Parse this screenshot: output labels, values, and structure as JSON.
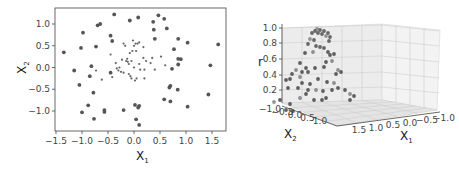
{
  "chart_data": [
    {
      "type": "scatter",
      "title": "",
      "xlabel": "X1",
      "ylabel": "X2",
      "xlim": [
        -1.5,
        1.8
      ],
      "ylim": [
        -1.45,
        1.35
      ],
      "xticks": [
        "-1.5",
        "-1.0",
        "-0.5",
        "0.0",
        "0.5",
        "1.0",
        "1.5"
      ],
      "yticks": [
        "1.0",
        "0.5",
        "0.0",
        "-0.5",
        "-1.0"
      ],
      "grid": false,
      "legend": null,
      "series": [
        {
          "name": "outer (large dots)",
          "marker": "circle",
          "color": "#555555",
          "points": [
            [
              -1.35,
              0.35
            ],
            [
              -1.15,
              -0.07
            ],
            [
              -1.05,
              -0.4
            ],
            [
              -1.02,
              0.45
            ],
            [
              -1.0,
              -1.03
            ],
            [
              -0.98,
              0.8
            ],
            [
              -0.88,
              -0.87
            ],
            [
              -0.85,
              -0.2
            ],
            [
              -0.82,
              0.03
            ],
            [
              -0.78,
              -0.58
            ],
            [
              -0.77,
              -1.18
            ],
            [
              -0.73,
              0.48
            ],
            [
              -0.7,
              0.97
            ],
            [
              -0.65,
              1.0
            ],
            [
              -0.57,
              -0.98
            ],
            [
              -0.57,
              -1.02
            ],
            [
              -0.45,
              0.73
            ],
            [
              -0.45,
              -0.12
            ],
            [
              -0.42,
              0.61
            ],
            [
              -0.38,
              1.22
            ],
            [
              -0.2,
              -0.98
            ],
            [
              -0.08,
              1.08
            ],
            [
              0.02,
              -0.86
            ],
            [
              0.04,
              -1.19
            ],
            [
              0.08,
              -0.92
            ],
            [
              0.1,
              -0.88
            ],
            [
              0.08,
              1.15
            ],
            [
              0.1,
              -1.32
            ],
            [
              0.37,
              1.05
            ],
            [
              0.38,
              0.87
            ],
            [
              0.4,
              0.66
            ],
            [
              0.47,
              1.2
            ],
            [
              0.58,
              1.12
            ],
            [
              0.63,
              0.9
            ],
            [
              0.58,
              -0.73
            ],
            [
              0.68,
              -0.46
            ],
            [
              0.7,
              -0.42
            ],
            [
              0.7,
              -0.78
            ],
            [
              0.73,
              -0.03
            ],
            [
              0.77,
              0.42
            ],
            [
              0.85,
              0.66
            ],
            [
              0.85,
              0.2
            ],
            [
              0.85,
              0.07
            ],
            [
              0.9,
              0.19
            ],
            [
              0.84,
              -0.51
            ],
            [
              1.03,
              0.57
            ],
            [
              1.03,
              -0.9
            ],
            [
              1.43,
              -0.62
            ],
            [
              1.47,
              0.05
            ],
            [
              1.62,
              0.53
            ]
          ]
        },
        {
          "name": "inner (small dots)",
          "marker": "circle-small",
          "color": "#666666",
          "points": [
            [
              -0.73,
              -0.07
            ],
            [
              -0.62,
              -0.28
            ],
            [
              -0.45,
              0.3
            ],
            [
              -0.42,
              -0.22
            ],
            [
              -0.35,
              0.1
            ],
            [
              -0.33,
              -0.02
            ],
            [
              -0.3,
              -0.07
            ],
            [
              -0.28,
              0.0
            ],
            [
              -0.25,
              -0.1
            ],
            [
              -0.23,
              0.18
            ],
            [
              -0.2,
              0.55
            ],
            [
              -0.2,
              -0.12
            ],
            [
              -0.17,
              0.5
            ],
            [
              -0.15,
              0.15
            ],
            [
              -0.13,
              0.2
            ],
            [
              -0.12,
              0.13
            ],
            [
              -0.1,
              -0.15
            ],
            [
              -0.1,
              0.08
            ],
            [
              -0.08,
              0.33
            ],
            [
              -0.07,
              -0.2
            ],
            [
              -0.05,
              0.15
            ],
            [
              -0.05,
              -0.25
            ],
            [
              -0.03,
              0.38
            ],
            [
              -0.02,
              0.62
            ],
            [
              0.0,
              0.5
            ],
            [
              0.0,
              0.0
            ],
            [
              0.02,
              -0.3
            ],
            [
              0.03,
              0.55
            ],
            [
              0.04,
              0.38
            ],
            [
              0.05,
              -0.25
            ],
            [
              0.07,
              0.55
            ],
            [
              0.1,
              0.58
            ],
            [
              0.1,
              0.08
            ],
            [
              0.12,
              -0.05
            ],
            [
              0.18,
              0.47
            ],
            [
              0.18,
              0.22
            ],
            [
              0.2,
              -0.05
            ],
            [
              0.2,
              -0.25
            ],
            [
              0.23,
              0.15
            ],
            [
              0.32,
              0.1
            ],
            [
              0.35,
              0.22
            ],
            [
              0.4,
              -0.05
            ],
            [
              0.52,
              0.25
            ],
            [
              0.6,
              0.05
            ]
          ]
        }
      ]
    },
    {
      "type": "scatter3d",
      "title": "",
      "xlabel": "X1",
      "ylabel": "X2",
      "zlabel": "r",
      "xticks": [
        "1.5",
        "1.0",
        "0.5",
        "0.0",
        "-0.5",
        "-1.0"
      ],
      "yticks": [
        "-1.0",
        "-0.5",
        "0.0",
        "0.5",
        "1.0"
      ],
      "zticks": [
        "0.2",
        "0.4",
        "0.6",
        "0.8",
        "1.0"
      ],
      "zlim": [
        0.0,
        1.0
      ],
      "grid": true,
      "legend": null,
      "description": "Points plotted with height r = radial (RBF-like) function of X1, X2; inner cluster points rise to a peak near r≈1.0 at the center, outer points lie lower (r≈0.1–0.5)",
      "series": [
        {
          "name": "r values",
          "marker": "circle",
          "color": "#555555",
          "screen_points": [
            [
              82,
              33
            ],
            [
              85,
              31
            ],
            [
              87,
              29
            ],
            [
              88,
              33
            ],
            [
              90,
              30
            ],
            [
              92,
              34
            ],
            [
              94,
              31
            ],
            [
              96,
              36
            ],
            [
              98,
              33
            ],
            [
              100,
              37
            ],
            [
              99,
              41
            ],
            [
              84,
              40
            ],
            [
              80,
              39
            ],
            [
              78,
              44
            ],
            [
              86,
              46
            ],
            [
              90,
              47
            ],
            [
              75,
              53
            ],
            [
              83,
              52
            ],
            [
              94,
              48
            ],
            [
              98,
              52
            ],
            [
              100,
              55
            ],
            [
              104,
              54
            ],
            [
              102,
              61
            ],
            [
              96,
              62
            ],
            [
              70,
              63
            ],
            [
              76,
              68
            ],
            [
              78,
              72
            ],
            [
              66,
              70
            ],
            [
              62,
              74
            ],
            [
              72,
              72
            ],
            [
              85,
              68
            ],
            [
              94,
              67
            ],
            [
              108,
              70
            ],
            [
              106,
              74
            ],
            [
              111,
              72
            ],
            [
              60,
              79
            ],
            [
              56,
              80
            ],
            [
              70,
              77
            ],
            [
              72,
              83
            ],
            [
              80,
              84
            ],
            [
              88,
              79
            ],
            [
              97,
              82
            ],
            [
              104,
              83
            ],
            [
              102,
              90
            ],
            [
              58,
              88
            ],
            [
              68,
              88
            ],
            [
              78,
              90
            ],
            [
              86,
              90
            ],
            [
              93,
              91
            ],
            [
              96,
              98
            ],
            [
              108,
              88
            ],
            [
              115,
              90
            ],
            [
              120,
              94
            ],
            [
              124,
              96
            ],
            [
              120,
              100
            ],
            [
              50,
              100
            ],
            [
              60,
              104
            ],
            [
              70,
              98
            ],
            [
              84,
              100
            ],
            [
              92,
              100
            ],
            [
              76,
              94
            ],
            [
              63,
              111
            ],
            [
              44,
              102
            ],
            [
              56,
              110
            ]
          ]
        }
      ]
    }
  ]
}
